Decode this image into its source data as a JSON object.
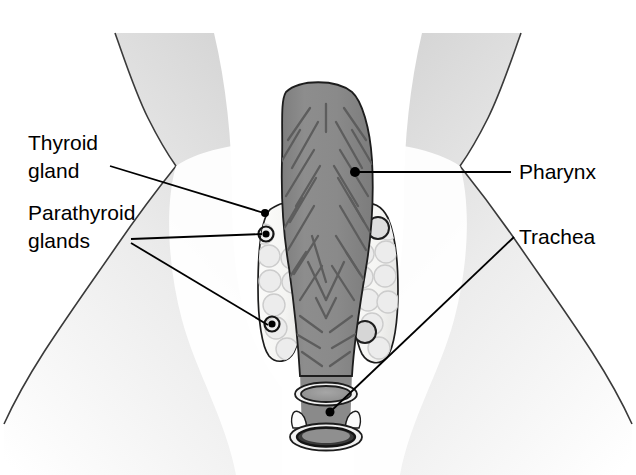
{
  "figure": {
    "type": "anatomical-illustration",
    "background_color": "#ffffff",
    "width": 636,
    "height": 475
  },
  "labels": {
    "thyroid_gland_line1": "Thyroid",
    "thyroid_gland_line2": "gland",
    "parathyroid_glands_line1": "Parathyroid",
    "parathyroid_glands_line2": "glands",
    "pharynx": "Pharynx",
    "trachea": "Trachea"
  },
  "colors": {
    "pharynx_muscle": "#8a8a8a",
    "pharynx_fiber": "#5e5e5e",
    "thyroid_lobe_fill": "#f7f7f5",
    "follicle_fill": "#ececec",
    "follicle_stroke": "#c9c9c9",
    "parathyroid_dark": "#101010",
    "outline": "#1a1a1a",
    "skin_light": "#f4f4f4",
    "skin_shadow": "#c8c8c8",
    "trachea_ring": "#9a9a9a",
    "label_text": "#000000"
  },
  "structures": {
    "pharynx": {
      "name": "pharynx",
      "description": "Central gray muscular tube with diagonal muscle fiber striations",
      "fiber_count": 34
    },
    "thyroid_left_lobe": {
      "name": "thyroid-left-lobe",
      "follicle_count": 9,
      "parathyroid_marker_count": 2
    },
    "thyroid_right_lobe": {
      "name": "thyroid-right-lobe",
      "follicle_count": 10,
      "parathyroid_marker_count": 2
    },
    "trachea": {
      "name": "trachea",
      "cartilage_ring_count": 2
    },
    "neck_silhouette": {
      "name": "neck-and-shoulders",
      "description": "Shaded neck and shoulder outline framing the glands"
    }
  },
  "leader_lines": [
    {
      "id": "thyroid-gland-leader",
      "from_label": "Thyroid gland",
      "to_structure": "thyroid-left-lobe"
    },
    {
      "id": "parathyroid-upper-leader",
      "from_label": "Parathyroid glands",
      "to_structure": "parathyroid-upper-left"
    },
    {
      "id": "parathyroid-lower-leader",
      "from_label": "Parathyroid glands",
      "to_structure": "parathyroid-lower-left"
    },
    {
      "id": "pharynx-leader",
      "from_label": "Pharynx",
      "to_structure": "pharynx"
    },
    {
      "id": "trachea-leader",
      "from_label": "Trachea",
      "to_structure": "trachea"
    }
  ]
}
